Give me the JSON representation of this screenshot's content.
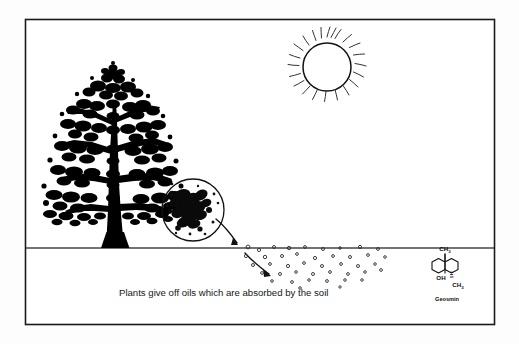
{
  "figure": {
    "name": "plants-give-off-oils-diagram",
    "background_color": "#fdfdfd",
    "ink_color": "#111111",
    "frame": {
      "name": "figure-border",
      "x": 25,
      "y": 19,
      "width": 470,
      "height": 306,
      "stroke_color": "#1a1a1a",
      "stroke_width": 1.6
    },
    "caption": "Plants give off oils which are absorbed by the soil",
    "ground_line": {
      "label": "soil-surface-line",
      "y": 248,
      "x_start": 26,
      "x_end": 494
    },
    "sun": {
      "label": "sun",
      "center_x": 327,
      "center_y": 67,
      "radius": 24,
      "ray_count": 22
    },
    "tree": {
      "label": "tree-silhouette",
      "trunk_base_x": 110,
      "canopy_top_y": 70,
      "fill": "#000000"
    },
    "magnifier": {
      "label": "magnifier-circle",
      "center_x": 193,
      "center_y": 210,
      "radius": 31,
      "content": "oil-droplets-on-leaf"
    },
    "arrows": [
      {
        "label": "oil-transfer-arrow-upper",
        "from_x": 219,
        "from_y": 222,
        "to_x": 240,
        "to_y": 245
      },
      {
        "label": "oil-transfer-arrow-lower",
        "from_x": 248,
        "from_y": 255,
        "to_x": 272,
        "to_y": 275
      }
    ],
    "particles_label": "oil-particles-in-soil",
    "particle_count": 40
  },
  "molecule": {
    "name": "geosmin-structure",
    "title": "Geosmin",
    "labels": {
      "methyl_top": "CH",
      "methyl_top_sub": "3",
      "hydroxyl": "OH",
      "methyl_bottom": "CH",
      "methyl_bottom_sub": "3"
    }
  }
}
